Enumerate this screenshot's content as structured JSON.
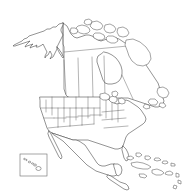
{
  "figure": {
    "kind": "outline-map",
    "width": 185,
    "height": 194,
    "background_color": "#ffffff",
    "outline_color": "#3a3a3a",
    "subdivision_color": "#5a5a5a",
    "fill_color": "#ffffff",
    "has_labels": false,
    "has_legend": false,
    "has_graticule": false,
    "projection_look": "conic"
  },
  "regions": {
    "alaska": {
      "name": "Alaska",
      "outline": "M 63,23 L 59,24 L 56,27 L 53,27 L 50,29 L 47,29 L 44,31 L 41,32 L 38,33 L 35,34 L 32,35 L 29,36 L 27,38 L 24,39 L 22,41 L 20,42 L 18,43 L 16,44 L 14,45 L 13,46 L 15,46 L 18,45 L 21,44 L 24,43 L 27,42 L 30,41 L 28,43 L 26,45 L 25,47 L 27,46 L 30,45 L 33,44 L 31,46 L 30,48 L 32,47 L 35,46 L 37,45 L 36,47 L 38,47 L 40,46 L 42,45 L 43,44 L 44,46 L 45,48 L 46,50 L 47,52 L 46,54 L 45,56 L 45,58 L 46,56 L 48,55 L 49,53 L 50,51 L 51,53 L 52,55 L 51,57 L 50,59 L 51,58 L 53,57 L 54,55 L 55,53 L 56,51 L 57,49 L 57,47 L 58,45 L 59,43 L 60,41 L 61,39 L 62,37 L 63,35 L 62,33 L 61,31 L 61,29 L 62,27 L 63,25 Z",
      "panhandle": "M 57,47 L 59,49 L 60,51 L 61,52 L 62,54 L 63,56 L 64,57 L 63,58 L 62,57 L 61,55 L 60,54 L 59,52 L 58,50 Z",
      "border": "M 63,23 L 63,56"
    },
    "canada_mainland": {
      "name": "Canada",
      "outline": "M 63,23 L 67,26 L 69,30 L 71,34 L 74,37 L 77,38 L 80,37 L 83,36 L 86,35 L 89,35 L 92,36 L 95,38 L 98,40 L 101,41 L 104,40 L 107,39 L 110,38 L 113,37 L 116,38 L 119,39 L 122,41 L 125,43 L 128,45 L 131,47 L 134,50 L 137,53 L 140,56 L 142,59 L 144,62 L 146,65 L 148,68 L 150,71 L 152,74 L 154,77 L 156,80 L 158,83 L 159,86 L 160,89 L 161,92 L 162,95 L 163,98 L 164,101 L 163,104 L 161,106 L 158,107 L 155,107 L 152,106 L 149,105 L 146,104 L 143,103 L 140,102 L 137,101 L 134,100 L 131,99 L 128,98 L 125,98 L 122,98 L 119,98 L 116,98 L 113,98 L 110,98 L 107,98 L 104,98 L 101,98 L 98,98 L 95,98 L 92,98 L 89,98 L 86,98 L 83,98 L 80,98 L 77,98 L 74,98 L 71,98 L 68,97 L 66,95 L 65,92 L 64,89 L 64,86 L 64,83 L 64,80 L 64,77 L 64,74 L 64,71 L 64,68 L 64,65 L 64,62 L 64,59 L 64,56 L 64,53 L 64,50 L 64,47 L 63,44 L 63,41 L 63,38 L 63,35 L 63,32 L 63,29 L 63,26 Z",
      "hudson_bay": "M 104,52 L 108,53 L 112,55 L 116,58 L 119,62 L 121,66 L 122,70 L 122,74 L 121,78 L 119,81 L 116,83 L 112,84 L 108,84 L 105,83 L 103,80 L 102,77 L 101,74 L 100,71 L 99,68 L 98,65 L 97,62 L 97,59 L 98,56 L 101,54 Z",
      "province_borders": [
        "M 64,60 L 66,94",
        "M 78,58 L 79,97",
        "M 92,57 L 93,97",
        "M 104,56 L 105,97",
        "M 64,52 L 128,46",
        "M 122,75 L 133,99"
      ]
    },
    "arctic_islands": {
      "name": "Canadian Arctic Archipelago",
      "shapes": [
        "M 78,26 L 82,25 L 86,26 L 89,28 L 90,31 L 88,33 L 84,34 L 80,33 L 77,31 L 76,28 Z",
        "M 92,22 L 97,21 L 101,23 L 103,26 L 101,29 L 97,30 L 93,29 L 90,26 Z",
        "M 105,25 L 110,24 L 114,26 L 116,29 L 114,32 L 110,33 L 106,32 L 104,29 Z",
        "M 118,28 L 123,27 L 127,29 L 129,33 L 127,36 L 123,37 L 119,36 L 117,32 Z",
        "M 95,33 L 100,33 L 104,35 L 105,38 L 102,40 L 98,40 L 94,38 L 93,35 Z",
        "M 108,36 L 113,36 L 117,38 L 118,41 L 115,43 L 111,43 L 107,41 L 106,38 Z",
        "M 126,40 L 133,39 L 140,42 L 146,47 L 150,53 L 151,59 L 148,64 L 143,66 L 137,65 L 132,61 L 129,56 L 127,50 L 125,45 Z",
        "M 71,28 L 75,28 L 78,30 L 77,33 L 73,34 L 70,32 Z",
        "M 85,20 L 89,19 L 92,21 L 91,24 L 87,25 L 84,23 Z"
      ]
    },
    "united_states": {
      "name": "United States (contiguous)",
      "outline": "M 40,97 L 44,97 L 48,97 L 52,97 L 56,97 L 60,97 L 64,97 L 68,97 L 72,97 L 76,97 L 80,97 L 84,97 L 88,97 L 92,97 L 96,97 L 100,97 L 104,97 L 108,99 L 111,101 L 114,103 L 117,104 L 120,103 L 123,101 L 126,100 L 129,101 L 132,103 L 135,105 L 138,107 L 141,110 L 143,113 L 145,116 L 146,119 L 145,122 L 143,124 L 140,126 L 137,128 L 134,130 L 131,132 L 128,134 L 126,137 L 125,140 L 124,143 L 123,146 L 121,148 L 118,149 L 115,149 L 112,148 L 109,147 L 106,146 L 103,145 L 100,144 L 97,143 L 94,142 L 91,141 L 88,140 L 85,140 L 82,140 L 79,140 L 76,140 L 73,140 L 70,139 L 67,138 L 64,137 L 61,136 L 58,135 L 55,134 L 52,133 L 49,131 L 47,128 L 46,125 L 45,122 L 44,119 L 43,116 L 42,113 L 41,110 L 40,107 L 40,104 L 40,101 Z",
      "state_borders": [
        "M 52,97 L 52,115",
        "M 64,97 L 64,122",
        "M 76,97 L 76,120",
        "M 88,97 L 88,118",
        "M 100,97 L 100,116",
        "M 41,108 L 52,108",
        "M 52,108 L 64,108",
        "M 64,108 L 76,108",
        "M 76,108 L 88,108",
        "M 88,108 L 100,108",
        "M 44,118 L 54,118",
        "M 54,118 L 66,118",
        "M 66,117 L 78,117",
        "M 78,116 L 90,116",
        "M 90,115 L 102,115",
        "M 48,128 L 58,127",
        "M 58,127 L 70,126",
        "M 70,126 L 82,125",
        "M 82,125 L 94,124",
        "M 58,108 L 58,127",
        "M 70,108 L 70,126",
        "M 82,108 L 82,125",
        "M 94,108 L 94,124",
        "M 106,100 L 106,118",
        "M 112,102 L 112,120",
        "M 118,104 L 118,122",
        "M 102,112 L 124,110",
        "M 102,120 L 126,118",
        "M 104,128 L 128,126",
        "M 46,100 L 46,112"
      ]
    },
    "great_lakes": {
      "name": "Great Lakes",
      "shapes": [
        "M 100,94 L 105,93 L 109,95 L 110,98 L 107,100 L 103,100 L 100,98 Z",
        "M 110,97 L 114,96 L 117,98 L 117,101 L 114,103 L 111,102 L 109,100 Z",
        "M 118,99 L 122,98 L 125,100 L 125,103 L 122,104 L 119,103 Z",
        "M 112,92 L 116,91 L 118,93 L 117,96 L 114,97 L 112,95 Z"
      ]
    },
    "mexico": {
      "name": "Mexico",
      "outline": "M 52,133 L 55,134 L 58,135 L 61,136 L 64,137 L 67,138 L 70,139 L 73,140 L 76,140 L 79,141 L 82,143 L 85,145 L 87,148 L 89,151 L 91,154 L 93,157 L 95,160 L 97,163 L 99,165 L 102,166 L 105,166 L 108,165 L 111,164 L 114,164 L 117,165 L 119,167 L 120,170 L 119,173 L 117,175 L 114,176 L 111,176 L 108,175 L 105,174 L 102,173 L 99,172 L 96,171 L 93,169 L 90,167 L 87,165 L 84,162 L 81,159 L 78,156 L 75,153 L 72,150 L 69,147 L 66,144 L 63,141 L 60,139 L 57,137 L 54,135 Z",
      "baja": "M 49,131 L 51,134 L 53,138 L 55,142 L 57,146 L 59,150 L 61,154 L 62,157 L 61,159 L 59,157 L 57,153 L 55,149 L 53,145 L 51,141 L 49,137 L 48,134 Z"
    },
    "central_america": {
      "name": "Central America",
      "outline": "M 108,175 L 111,176 L 114,178 L 117,180 L 120,182 L 123,183 L 126,184 L 128,186 L 129,189 L 127,190 L 124,189 L 121,187 L 118,185 L 115,183 L 112,181 L 109,179 L 107,177 Z",
      "yucatan": "M 114,164 L 118,164 L 121,166 L 122,170 L 121,174 L 118,176 L 116,174 L 115,170 L 114,167 Z"
    },
    "caribbean": {
      "name": "Caribbean Islands",
      "shapes": [
        "M 131,163 L 137,162 L 143,163 L 148,165 L 151,167 L 148,169 L 143,169 L 137,168 L 132,166 Z",
        "M 152,170 L 157,169 L 162,171 L 164,173 L 161,175 L 156,175 L 152,173 Z",
        "M 166,172 L 170,171 L 173,173 L 172,175 L 168,175 L 165,174 Z",
        "M 139,174 L 144,174 L 147,176 L 145,178 L 140,177 Z",
        "M 176,173 L 179,174 L 179,177 L 176,177 Z",
        "M 178,180 L 181,181 L 181,184 L 178,183 Z",
        "M 174,185 L 177,186 L 176,189 L 173,188 Z",
        "M 127,157 L 131,156 L 134,158 L 131,160 L 127,159 Z",
        "M 136,153 L 140,153 L 142,155 L 139,157 L 136,156 Z",
        "M 145,156 L 149,156 L 151,158 L 148,160 L 145,159 Z",
        "M 155,158 L 159,158 L 161,160 L 157,161 L 154,160 Z",
        "M 163,161 L 167,161 L 168,163 L 165,164 L 162,163 Z",
        "M 171,163 L 175,164 L 175,166 L 171,166 Z"
      ]
    },
    "florida_peninsula": {
      "name": "Florida",
      "outline": "M 123,146 L 126,149 L 128,153 L 129,157 L 128,160 L 126,161 L 124,158 L 123,154 L 122,150 Z"
    },
    "newfoundland": {
      "name": "Newfoundland and Maritimes",
      "shapes": [
        "M 158,88 L 163,87 L 167,89 L 169,93 L 167,97 L 163,98 L 159,96 L 157,92 Z",
        "M 150,99 L 155,99 L 158,102 L 156,105 L 151,105 L 148,102 Z",
        "M 160,103 L 164,103 L 166,106 L 163,108 L 159,106 Z",
        "M 145,104 L 149,105 L 150,108 L 146,109 L 143,107 Z"
      ]
    },
    "hawaii_inset": {
      "name": "Hawaii inset",
      "frame": {
        "x": 20,
        "y": 154,
        "width": 27,
        "height": 22
      },
      "islands": [
        {
          "cx": 24.5,
          "cy": 159.0,
          "rx": 0.9,
          "ry": 0.7
        },
        {
          "cx": 26.5,
          "cy": 160.0,
          "rx": 0.7,
          "ry": 0.6
        },
        {
          "cx": 29.5,
          "cy": 162.0,
          "rx": 1.3,
          "ry": 0.8
        },
        {
          "cx": 32.5,
          "cy": 163.5,
          "rx": 1.0,
          "ry": 0.7
        },
        {
          "cx": 35.0,
          "cy": 165.0,
          "rx": 1.5,
          "ry": 1.0
        },
        {
          "cx": 38.5,
          "cy": 168.5,
          "rx": 2.6,
          "ry": 2.0
        }
      ]
    }
  }
}
